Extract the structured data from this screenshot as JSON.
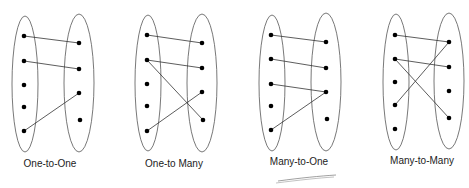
{
  "diagrams": [
    {
      "label": "One-to-One",
      "left_ellipse": {
        "cx": 25,
        "cy": 84,
        "rx": 13,
        "ry": 68
      },
      "right_ellipse": {
        "cx": 79,
        "cy": 83,
        "rx": 15,
        "ry": 69
      },
      "left_dots": [
        [
          24,
          36
        ],
        [
          24,
          61
        ],
        [
          24,
          85
        ],
        [
          24,
          107
        ],
        [
          24,
          131
        ]
      ],
      "right_dots": [
        [
          79,
          43
        ],
        [
          79,
          69
        ],
        [
          79,
          93
        ],
        [
          80,
          120
        ]
      ],
      "edges": [
        [
          0,
          0
        ],
        [
          1,
          1
        ],
        [
          4,
          2
        ]
      ],
      "label_pos": [
        50,
        167
      ]
    },
    {
      "label": "One-to Many",
      "left_ellipse": {
        "cx": 148,
        "cy": 83,
        "rx": 13,
        "ry": 68
      },
      "right_ellipse": {
        "cx": 202,
        "cy": 83,
        "rx": 15,
        "ry": 69
      },
      "left_dots": [
        [
          147,
          35
        ],
        [
          147,
          60
        ],
        [
          147,
          84
        ],
        [
          147,
          106
        ],
        [
          147,
          131
        ]
      ],
      "right_dots": [
        [
          202,
          43
        ],
        [
          202,
          68
        ],
        [
          202,
          92
        ],
        [
          203,
          120
        ]
      ],
      "edges": [
        [
          0,
          0
        ],
        [
          1,
          1
        ],
        [
          1,
          3
        ],
        [
          4,
          2
        ]
      ],
      "label_pos": [
        174,
        167
      ]
    },
    {
      "label": "Many-to-One",
      "left_ellipse": {
        "cx": 272,
        "cy": 83,
        "rx": 13,
        "ry": 68
      },
      "right_ellipse": {
        "cx": 326,
        "cy": 82,
        "rx": 15,
        "ry": 69
      },
      "left_dots": [
        [
          271,
          35
        ],
        [
          271,
          59
        ],
        [
          271,
          84
        ],
        [
          271,
          106
        ],
        [
          271,
          130
        ]
      ],
      "right_dots": [
        [
          326,
          42
        ],
        [
          326,
          68
        ],
        [
          326,
          92
        ],
        [
          327,
          119
        ]
      ],
      "edges": [
        [
          0,
          0
        ],
        [
          1,
          1
        ],
        [
          2,
          2
        ],
        [
          4,
          2
        ]
      ],
      "label_pos": [
        299,
        165
      ],
      "underline": true
    },
    {
      "label": "Many-to-Many",
      "left_ellipse": {
        "cx": 396,
        "cy": 82,
        "rx": 13,
        "ry": 68
      },
      "right_ellipse": {
        "cx": 449,
        "cy": 81,
        "rx": 15,
        "ry": 68
      },
      "left_dots": [
        [
          395,
          35
        ],
        [
          395,
          59
        ],
        [
          395,
          82
        ],
        [
          395,
          105
        ],
        [
          395,
          129
        ]
      ],
      "right_dots": [
        [
          449,
          42
        ],
        [
          449,
          67
        ],
        [
          449,
          91
        ],
        [
          449,
          118
        ]
      ],
      "edges": [
        [
          0,
          0
        ],
        [
          1,
          1
        ],
        [
          1,
          3
        ],
        [
          3,
          0
        ]
      ],
      "label_pos": [
        422,
        164
      ]
    }
  ]
}
